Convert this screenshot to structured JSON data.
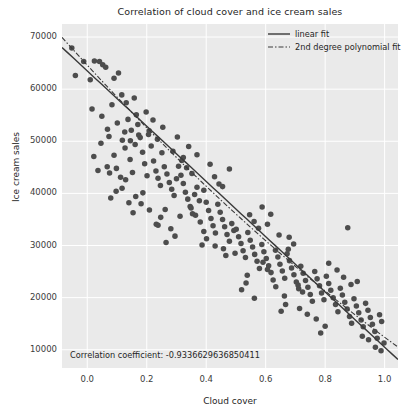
{
  "chart_data": {
    "type": "scatter",
    "title": "Correlation of cloud cover and ice cream sales",
    "xlabel": "Cloud cover",
    "ylabel": "Ice cream sales",
    "xlim": [
      -0.085,
      1.045
    ],
    "ylim": [
      6500,
      72500
    ],
    "xticks": [
      "0.0",
      "0.2",
      "0.4",
      "0.6",
      "0.8",
      "1.0"
    ],
    "xtick_values": [
      0.0,
      0.2,
      0.4,
      0.6,
      0.8,
      1.0
    ],
    "yticks": [
      "10000",
      "20000",
      "30000",
      "40000",
      "50000",
      "60000",
      "70000"
    ],
    "ytick_values": [
      10000,
      20000,
      30000,
      40000,
      50000,
      60000,
      70000
    ],
    "grid": true,
    "grid_color": "#ffffff",
    "axes_facecolor": "#eaeaea",
    "figure_facecolor": "#ffffff",
    "marker_color": "#4d4d4d",
    "marker_size": 4.0,
    "legend_position": "upper right",
    "annotation": "Correlation coefficient: -0.9336629636850411",
    "correlation_coefficient": -0.9336629636850411,
    "series": [
      {
        "name": "data",
        "points": [
          [
            -0.052,
            67900
          ],
          [
            -0.04,
            62600
          ],
          [
            -0.012,
            65300
          ],
          [
            0.01,
            61800
          ],
          [
            0.024,
            65400
          ],
          [
            0.041,
            65300
          ],
          [
            0.052,
            64700
          ],
          [
            0.062,
            64200
          ],
          [
            0.083,
            57000
          ],
          [
            0.09,
            62100
          ],
          [
            0.016,
            56200
          ],
          [
            0.049,
            54800
          ],
          [
            0.068,
            52300
          ],
          [
            0.105,
            63100
          ],
          [
            0.116,
            58900
          ],
          [
            0.131,
            57400
          ],
          [
            0.137,
            54200
          ],
          [
            0.148,
            52100
          ],
          [
            0.158,
            58300
          ],
          [
            0.165,
            55100
          ],
          [
            0.118,
            50200
          ],
          [
            0.127,
            48700
          ],
          [
            0.09,
            47300
          ],
          [
            0.022,
            47100
          ],
          [
            0.036,
            44400
          ],
          [
            0.067,
            45100
          ],
          [
            0.075,
            43900
          ],
          [
            0.098,
            44800
          ],
          [
            0.112,
            43100
          ],
          [
            0.129,
            42600
          ],
          [
            0.144,
            46500
          ],
          [
            0.152,
            44000
          ],
          [
            0.161,
            49400
          ],
          [
            0.17,
            53200
          ],
          [
            0.178,
            50700
          ],
          [
            0.186,
            47900
          ],
          [
            0.193,
            45700
          ],
          [
            0.201,
            43400
          ],
          [
            0.208,
            52000
          ],
          [
            0.215,
            49100
          ],
          [
            0.223,
            46200
          ],
          [
            0.231,
            44300
          ],
          [
            0.238,
            42900
          ],
          [
            0.246,
            41500
          ],
          [
            0.187,
            40100
          ],
          [
            0.163,
            39400
          ],
          [
            0.14,
            38200
          ],
          [
            0.117,
            41000
          ],
          [
            0.097,
            40400
          ],
          [
            0.079,
            39100
          ],
          [
            0.206,
            51300
          ],
          [
            0.221,
            54100
          ],
          [
            0.236,
            50400
          ],
          [
            0.251,
            47800
          ],
          [
            0.259,
            45100
          ],
          [
            0.268,
            43700
          ],
          [
            0.276,
            42100
          ],
          [
            0.284,
            40800
          ],
          [
            0.292,
            39600
          ],
          [
            0.3,
            42800
          ],
          [
            0.307,
            45200
          ],
          [
            0.315,
            43500
          ],
          [
            0.323,
            41900
          ],
          [
            0.33,
            40200
          ],
          [
            0.338,
            38900
          ],
          [
            0.346,
            37500
          ],
          [
            0.354,
            36100
          ],
          [
            0.361,
            39800
          ],
          [
            0.369,
            41200
          ],
          [
            0.377,
            38600
          ],
          [
            0.262,
            36900
          ],
          [
            0.247,
            35400
          ],
          [
            0.232,
            34100
          ],
          [
            0.288,
            48100
          ],
          [
            0.303,
            50800
          ],
          [
            0.318,
            46300
          ],
          [
            0.334,
            44900
          ],
          [
            0.349,
            37200
          ],
          [
            0.364,
            35800
          ],
          [
            0.38,
            34500
          ],
          [
            0.392,
            40600
          ],
          [
            0.4,
            38300
          ],
          [
            0.408,
            36700
          ],
          [
            0.416,
            35200
          ],
          [
            0.423,
            33800
          ],
          [
            0.431,
            32400
          ],
          [
            0.439,
            37900
          ],
          [
            0.447,
            36400
          ],
          [
            0.455,
            35000
          ],
          [
            0.462,
            33600
          ],
          [
            0.47,
            32100
          ],
          [
            0.478,
            30800
          ],
          [
            0.486,
            34200
          ],
          [
            0.493,
            32900
          ],
          [
            0.401,
            31300
          ],
          [
            0.386,
            30100
          ],
          [
            0.413,
            45600
          ],
          [
            0.428,
            43200
          ],
          [
            0.443,
            41800
          ],
          [
            0.458,
            29400
          ],
          [
            0.466,
            28100
          ],
          [
            0.501,
            33100
          ],
          [
            0.509,
            31700
          ],
          [
            0.517,
            30400
          ],
          [
            0.524,
            29000
          ],
          [
            0.532,
            27700
          ],
          [
            0.54,
            32500
          ],
          [
            0.548,
            31000
          ],
          [
            0.556,
            29700
          ],
          [
            0.563,
            28300
          ],
          [
            0.571,
            27000
          ],
          [
            0.579,
            25600
          ],
          [
            0.587,
            30200
          ],
          [
            0.594,
            28800
          ],
          [
            0.602,
            27500
          ],
          [
            0.61,
            26100
          ],
          [
            0.618,
            24800
          ],
          [
            0.625,
            23400
          ],
          [
            0.534,
            22800
          ],
          [
            0.519,
            21500
          ],
          [
            0.546,
            35900
          ],
          [
            0.561,
            34600
          ],
          [
            0.576,
            33300
          ],
          [
            0.591,
            26800
          ],
          [
            0.606,
            25400
          ],
          [
            0.633,
            29100
          ],
          [
            0.641,
            27800
          ],
          [
            0.648,
            26400
          ],
          [
            0.656,
            25100
          ],
          [
            0.664,
            23700
          ],
          [
            0.672,
            28400
          ],
          [
            0.68,
            27100
          ],
          [
            0.687,
            25700
          ],
          [
            0.695,
            24400
          ],
          [
            0.703,
            23000
          ],
          [
            0.711,
            21700
          ],
          [
            0.718,
            26000
          ],
          [
            0.726,
            24700
          ],
          [
            0.734,
            23300
          ],
          [
            0.742,
            22000
          ],
          [
            0.75,
            20600
          ],
          [
            0.757,
            19300
          ],
          [
            0.667,
            18700
          ],
          [
            0.652,
            17400
          ],
          [
            0.679,
            31600
          ],
          [
            0.694,
            30300
          ],
          [
            0.709,
            22400
          ],
          [
            0.724,
            21100
          ],
          [
            0.765,
            25000
          ],
          [
            0.773,
            23600
          ],
          [
            0.781,
            22300
          ],
          [
            0.788,
            20900
          ],
          [
            0.796,
            19600
          ],
          [
            0.804,
            24100
          ],
          [
            0.812,
            22700
          ],
          [
            0.819,
            21400
          ],
          [
            0.827,
            20000
          ],
          [
            0.835,
            18700
          ],
          [
            0.843,
            17300
          ],
          [
            0.851,
            21800
          ],
          [
            0.858,
            20500
          ],
          [
            0.866,
            19100
          ],
          [
            0.874,
            17800
          ],
          [
            0.882,
            16400
          ],
          [
            0.889,
            15100
          ],
          [
            0.8,
            14500
          ],
          [
            0.785,
            13200
          ],
          [
            0.876,
            33400
          ],
          [
            0.897,
            19800
          ],
          [
            0.905,
            18400
          ],
          [
            0.913,
            17100
          ],
          [
            0.921,
            15700
          ],
          [
            0.928,
            14400
          ],
          [
            0.936,
            18900
          ],
          [
            0.944,
            17600
          ],
          [
            0.952,
            16200
          ],
          [
            0.959,
            14900
          ],
          [
            0.967,
            13500
          ],
          [
            0.975,
            12200
          ],
          [
            0.983,
            16700
          ],
          [
            0.99,
            15400
          ],
          [
            0.998,
            11300
          ],
          [
            0.925,
            12600
          ],
          [
            0.946,
            11900
          ],
          [
            0.969,
            10500
          ],
          [
            0.988,
            9800
          ],
          [
            0.455,
            41300
          ],
          [
            0.478,
            44700
          ],
          [
            0.369,
            47400
          ],
          [
            0.341,
            49000
          ],
          [
            0.312,
            35600
          ],
          [
            0.281,
            33200
          ],
          [
            0.254,
            52700
          ],
          [
            0.198,
            55600
          ],
          [
            0.173,
            51200
          ],
          [
            0.145,
            50100
          ],
          [
            0.606,
            34100
          ],
          [
            0.634,
            22100
          ],
          [
            0.663,
            20300
          ],
          [
            0.562,
            19900
          ],
          [
            0.538,
            24300
          ],
          [
            0.497,
            28500
          ],
          [
            0.43,
            29900
          ],
          [
            0.392,
            32700
          ],
          [
            0.352,
            43800
          ],
          [
            0.323,
            46900
          ],
          [
            0.295,
            31800
          ],
          [
            0.265,
            30600
          ],
          [
            0.238,
            33900
          ],
          [
            0.209,
            36800
          ],
          [
            0.181,
            38000
          ],
          [
            0.154,
            36300
          ],
          [
            0.126,
            51800
          ],
          [
            0.101,
            53500
          ],
          [
            0.073,
            50900
          ],
          [
            0.046,
            49600
          ],
          [
            0.714,
            17900
          ],
          [
            0.74,
            16800
          ],
          [
            0.77,
            15900
          ],
          [
            0.812,
            26600
          ],
          [
            0.84,
            25300
          ],
          [
            0.862,
            23900
          ],
          [
            0.887,
            22500
          ],
          [
            0.908,
            23100
          ],
          [
            0.588,
            37400
          ],
          [
            0.617,
            36000
          ],
          [
            0.645,
            32000
          ],
          [
            0.676,
            29300
          ]
        ]
      }
    ],
    "fits": [
      {
        "name": "linear fit",
        "label": "linear fit",
        "style": "solid",
        "color": "#3a3a3a",
        "slope": -53000,
        "intercept": 63500
      },
      {
        "name": "2nd degree polynomial fit",
        "label": "2nd degree polynomial fit",
        "style": "dashdot",
        "color": "#3a3a3a",
        "a2": 9800,
        "a1": -62000,
        "a0": 64600
      }
    ]
  }
}
